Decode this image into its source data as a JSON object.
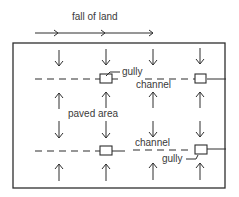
{
  "diagram": {
    "title": "fall of land",
    "labels": {
      "gully_top": "gully",
      "channel_top": "channel",
      "paved_area": "paved area",
      "channel_bottom": "channel",
      "gully_bottom": "gully"
    },
    "colors": {
      "ink": "#2e2e2e",
      "text": "#3a3a3a",
      "background": "#ffffff"
    },
    "elements": {
      "fall_arrow_heads": 3,
      "down_arrows_row1": 4,
      "up_arrows_row1": 4,
      "down_arrows_row2": 4,
      "up_arrows_row2": 4,
      "channels": 2,
      "gullies_per_channel": 2
    }
  }
}
